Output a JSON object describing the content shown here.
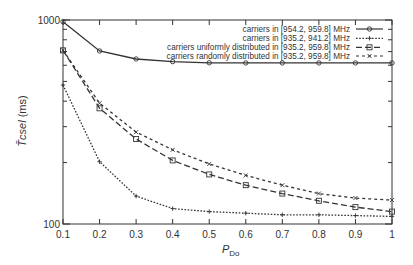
{
  "chart_data": {
    "type": "line",
    "title": "",
    "xlabel": "P_Do",
    "xlabel_main": "P",
    "xlabel_sub": "Do",
    "ylabel": "T̄csel (ms)",
    "ylabel_main": "T̄csel",
    "ylabel_unit": "(ms)",
    "yscale": "log",
    "xlim": [
      0.1,
      1
    ],
    "ylim": [
      100,
      1000
    ],
    "grid": false,
    "legend_position": "upper right",
    "x": [
      0.1,
      0.2,
      0.3,
      0.4,
      0.5,
      0.6,
      0.7,
      0.8,
      0.9,
      1.0
    ],
    "x_tick_labels": [
      "0.1",
      "0.2",
      "0.3",
      "0.4",
      "0.5",
      "0.6",
      "0.7",
      "0.8",
      "0.9",
      "1"
    ],
    "y_tick_labels": [
      "100",
      "1000"
    ],
    "series": [
      {
        "name": "carriers in [954.2, 959.8] MHz",
        "style": "solid",
        "marker": "circle",
        "values": [
          980,
          705,
          644,
          625,
          617,
          616,
          616,
          616,
          616,
          616
        ]
      },
      {
        "name": "carriers in [935.2, 941.2] MHz",
        "style": "dotted",
        "marker": "plus",
        "values": [
          480,
          202,
          137,
          119,
          115,
          113,
          111,
          111,
          110,
          109
        ]
      },
      {
        "name": "carriers uniformly distributed in [935.2, 959.8] MHz",
        "style": "dashed",
        "marker": "square",
        "values": [
          710,
          369,
          261,
          205,
          175,
          155,
          141,
          130,
          121,
          115
        ]
      },
      {
        "name": "carriers randomly distributed in [935.2, 959.8] MHz",
        "style": "short-dashed",
        "marker": "x",
        "values": [
          710,
          391,
          282,
          231,
          197,
          173,
          155,
          141,
          134,
          131
        ]
      }
    ]
  }
}
